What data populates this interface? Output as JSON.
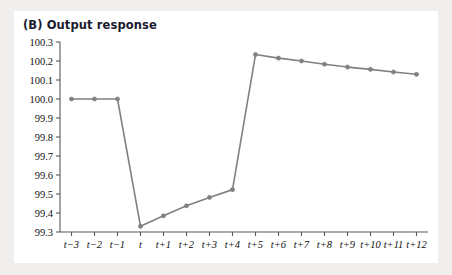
{
  "figure": {
    "title": "(B) Output response",
    "background_color": "#f1efed",
    "card_color": "#ffffff",
    "line_color": "#808080",
    "marker_color": "#808080",
    "axis_color": "#595959",
    "text_color": "#111111"
  },
  "chart_data": {
    "type": "line",
    "title": "(B) Output response",
    "xlabel": "",
    "ylabel": "",
    "grid": false,
    "legend": "none",
    "ylim": [
      99.3,
      100.3
    ],
    "ytick_labels": [
      "100.3",
      "100.2",
      "100.1",
      "100.0",
      "99.9",
      "99.8",
      "99.7",
      "99.6",
      "99.5",
      "99.4",
      "99.3"
    ],
    "ytick_values": [
      100.3,
      100.2,
      100.1,
      100.0,
      99.9,
      99.8,
      99.7,
      99.6,
      99.5,
      99.4,
      99.3
    ],
    "categories": [
      "t−3",
      "t−2",
      "t−1",
      "t",
      "t+1",
      "t+2",
      "t+3",
      "t+4",
      "t+5",
      "t+6",
      "t+7",
      "t+8",
      "t+9",
      "t+10",
      "t+11",
      "t+12"
    ],
    "series": [
      {
        "name": "Output response",
        "values": [
          100.0,
          100.0,
          100.0,
          99.33,
          99.385,
          99.438,
          99.482,
          99.523,
          100.234,
          100.215,
          100.2,
          100.183,
          100.168,
          100.156,
          100.142,
          100.13
        ]
      }
    ]
  }
}
